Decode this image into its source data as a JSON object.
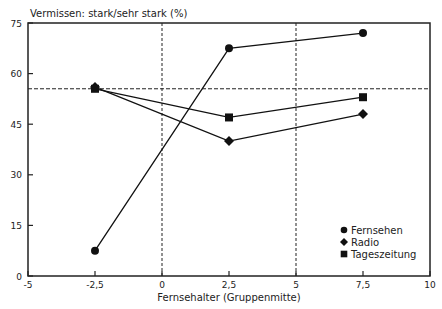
{
  "chart_data": {
    "type": "line",
    "title": "Vermissen: stark/sehr stark (%)",
    "xlabel": "Fernsehalter (Gruppenmitte)",
    "ylabel": "Vermissen: stark/sehr stark (%)",
    "xlim": [
      -5,
      10
    ],
    "ylim": [
      0,
      75
    ],
    "x_ticks": [
      "-5",
      "-2,5",
      "0",
      "2,5",
      "5",
      "7,5",
      "10"
    ],
    "y_ticks": [
      "0",
      "15",
      "30",
      "45",
      "60",
      "75"
    ],
    "x": [
      -2.5,
      2.5,
      7.5
    ],
    "series": [
      {
        "name": "Fernsehen",
        "marker": "circle",
        "values": [
          7.5,
          67.5,
          72
        ]
      },
      {
        "name": "Radio",
        "marker": "diamond",
        "values": [
          56,
          40,
          48
        ]
      },
      {
        "name": "Tageszeitung",
        "marker": "square",
        "values": [
          55.5,
          47,
          53
        ]
      }
    ],
    "reference_lines": {
      "horizontal_y": 55.5,
      "vertical_x": [
        0,
        5
      ]
    },
    "legend_position": "lower right",
    "grid": false
  },
  "text": {
    "title": "Vermissen: stark/sehr stark (%)",
    "xlabel": "Fernsehalter (Gruppenmitte)",
    "legend": [
      "Fernsehen",
      "Radio",
      "Tageszeitung"
    ]
  }
}
